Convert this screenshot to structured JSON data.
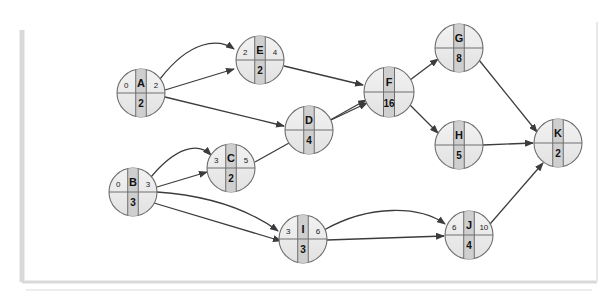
{
  "figure": {
    "kind": "activity-on-node network diagram",
    "frame_color": "#d6d6d6",
    "background": "#ffffff"
  },
  "style": {
    "node_fill": "#ebebeb",
    "node_band_fill": "#cfcfcf",
    "node_stroke": "#6e6e6e",
    "edge_color": "#3c3c3c",
    "text_color": "#111111"
  },
  "chart_data": {
    "type": "diagram",
    "title": "",
    "nodes": [
      {
        "id": "A",
        "label": "A",
        "left": "0",
        "right": "2",
        "bottom": "2",
        "cx": 141,
        "cy": 93,
        "r": 24
      },
      {
        "id": "E",
        "label": "E",
        "left": "2",
        "right": "4",
        "bottom": "2",
        "cx": 260,
        "cy": 60,
        "r": 24
      },
      {
        "id": "D",
        "label": "D",
        "left": "",
        "right": "",
        "bottom": "4",
        "cx": 309,
        "cy": 130,
        "r": 24
      },
      {
        "id": "F",
        "label": "F",
        "left": "",
        "right": "",
        "bottom": "16",
        "cx": 389,
        "cy": 92,
        "r": 25
      },
      {
        "id": "G",
        "label": "G",
        "left": "",
        "right": "",
        "bottom": "8",
        "cx": 459,
        "cy": 48,
        "r": 24
      },
      {
        "id": "H",
        "label": "H",
        "left": "",
        "right": "",
        "bottom": "5",
        "cx": 459,
        "cy": 145,
        "r": 24
      },
      {
        "id": "K",
        "label": "K",
        "left": "",
        "right": "",
        "bottom": "2",
        "cx": 558,
        "cy": 143,
        "r": 24
      },
      {
        "id": "B",
        "label": "B",
        "left": "0",
        "right": "3",
        "bottom": "3",
        "cx": 133,
        "cy": 192,
        "r": 24
      },
      {
        "id": "C",
        "label": "C",
        "left": "3",
        "right": "5",
        "bottom": "2",
        "cx": 231,
        "cy": 168,
        "r": 24
      },
      {
        "id": "I",
        "label": "I",
        "left": "3",
        "right": "6",
        "bottom": "3",
        "cx": 303,
        "cy": 239,
        "r": 24
      },
      {
        "id": "J",
        "label": "J",
        "left": "6",
        "right": "10",
        "bottom": "4",
        "cx": 469,
        "cy": 235,
        "r": 24
      }
    ],
    "edges": [
      {
        "from": "A",
        "to": "E",
        "shape": "curve",
        "d": "M 160,79 C 190,40 218,38 234,49"
      },
      {
        "from": "A",
        "to": "E",
        "shape": "line",
        "d": "M 165,90 L 234,69"
      },
      {
        "from": "A",
        "to": "D",
        "shape": "line",
        "d": "M 165,97 L 284,126"
      },
      {
        "from": "E",
        "to": "F",
        "shape": "line",
        "d": "M 284,66 L 363,85"
      },
      {
        "from": "D",
        "to": "F",
        "shape": "line",
        "d": "M 331,120 L 367,103"
      },
      {
        "from": "C",
        "to": "F",
        "shape": "line",
        "d": "M 255,162 L 366,100"
      },
      {
        "from": "F",
        "to": "G",
        "shape": "line",
        "d": "M 410,80 L 438,59"
      },
      {
        "from": "F",
        "to": "H",
        "shape": "line",
        "d": "M 410,105 L 438,133"
      },
      {
        "from": "G",
        "to": "K",
        "shape": "line",
        "d": "M 479,60 L 537,132"
      },
      {
        "from": "H",
        "to": "K",
        "shape": "line",
        "d": "M 483,145 L 533,143"
      },
      {
        "from": "J",
        "to": "K",
        "shape": "line",
        "d": "M 490,224 L 543,163"
      },
      {
        "from": "B",
        "to": "C",
        "shape": "curve",
        "d": "M 151,177 C 176,147 198,142 211,155"
      },
      {
        "from": "B",
        "to": "C",
        "shape": "line",
        "d": "M 157,187 L 207,172"
      },
      {
        "from": "B",
        "to": "I",
        "shape": "curve",
        "d": "M 157,192 C 215,196 252,212 278,231"
      },
      {
        "from": "B",
        "to": "I",
        "shape": "line",
        "d": "M 154,203 L 281,241"
      },
      {
        "from": "I",
        "to": "J",
        "shape": "curve",
        "d": "M 324,230 C 370,204 420,206 445,224"
      },
      {
        "from": "I",
        "to": "J",
        "shape": "line",
        "d": "M 327,240 L 444,236"
      }
    ]
  }
}
